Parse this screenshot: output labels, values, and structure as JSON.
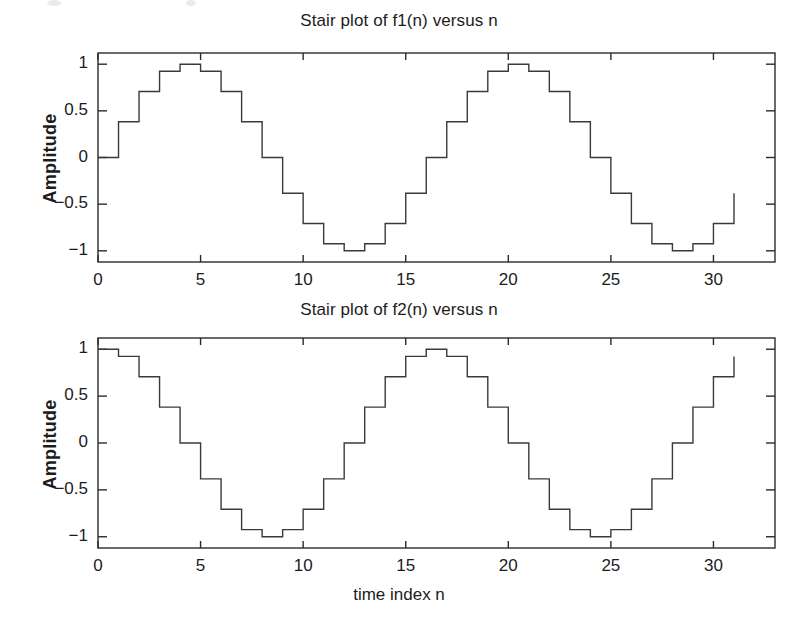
{
  "figure": {
    "background_color": "#ffffff",
    "line_color": "#3a3a3a",
    "axis_color": "#2b2b2b",
    "text_color": "#1c1c1c"
  },
  "chart_data": [
    {
      "type": "line",
      "subtype": "stairs",
      "title": "Stair plot of f1(n) versus n",
      "xlabel": "",
      "ylabel": "Amplitude",
      "xlim": [
        0,
        33
      ],
      "ylim": [
        -1.12,
        1.12
      ],
      "xticks": [
        0,
        5,
        10,
        15,
        20,
        25,
        30
      ],
      "xticklabels": [
        "0",
        "5",
        "10",
        "15",
        "20",
        "25",
        "30"
      ],
      "yticks": [
        1,
        0.5,
        0,
        -0.5,
        -1
      ],
      "yticklabels": [
        "1",
        "0.5",
        "0",
        "−0.5",
        "−1"
      ],
      "grid": false,
      "legend": "none",
      "expression": "f1(n) = sin(2*pi*n/16)",
      "x": [
        0,
        1,
        2,
        3,
        4,
        5,
        6,
        7,
        8,
        9,
        10,
        11,
        12,
        13,
        14,
        15,
        16,
        17,
        18,
        19,
        20,
        21,
        22,
        23,
        24,
        25,
        26,
        27,
        28,
        29,
        30,
        31
      ],
      "values": [
        0,
        0.383,
        0.707,
        0.924,
        1,
        0.924,
        0.707,
        0.383,
        0,
        -0.383,
        -0.707,
        -0.924,
        -1,
        -0.924,
        -0.707,
        -0.383,
        0,
        0.383,
        0.707,
        0.924,
        1,
        0.924,
        0.707,
        0.383,
        0,
        -0.383,
        -0.707,
        -0.924,
        -1,
        -0.924,
        -0.707,
        -0.383
      ]
    },
    {
      "type": "line",
      "subtype": "stairs",
      "title": "Stair plot of f2(n) versus n",
      "xlabel": "time index n",
      "ylabel": "Amplitude",
      "xlim": [
        0,
        33
      ],
      "ylim": [
        -1.12,
        1.12
      ],
      "xticks": [
        0,
        5,
        10,
        15,
        20,
        25,
        30
      ],
      "xticklabels": [
        "0",
        "5",
        "10",
        "15",
        "20",
        "25",
        "30"
      ],
      "yticks": [
        1,
        0.5,
        0,
        -0.5,
        -1
      ],
      "yticklabels": [
        "1",
        "0.5",
        "0",
        "−0.5",
        "−1"
      ],
      "grid": false,
      "legend": "none",
      "expression": "f2(n) = cos(2*pi*n/16)",
      "x": [
        0,
        1,
        2,
        3,
        4,
        5,
        6,
        7,
        8,
        9,
        10,
        11,
        12,
        13,
        14,
        15,
        16,
        17,
        18,
        19,
        20,
        21,
        22,
        23,
        24,
        25,
        26,
        27,
        28,
        29,
        30,
        31
      ],
      "values": [
        1,
        0.924,
        0.707,
        0.383,
        0,
        -0.383,
        -0.707,
        -0.924,
        -1,
        -0.924,
        -0.707,
        -0.383,
        0,
        0.383,
        0.707,
        0.924,
        1,
        0.924,
        0.707,
        0.383,
        0,
        -0.383,
        -0.707,
        -0.924,
        -1,
        -0.924,
        -0.707,
        -0.383,
        0,
        0.383,
        0.707,
        0.924
      ]
    }
  ]
}
